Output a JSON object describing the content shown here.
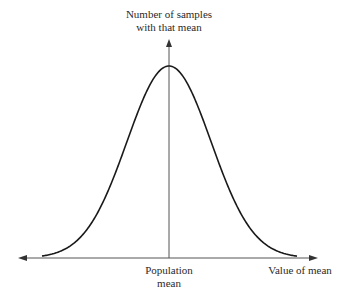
{
  "chart_data": {
    "type": "line",
    "title": "",
    "ylabel": "Number of samples with that mean",
    "xlabel": "Value of mean",
    "x_ticks": [
      "Population mean"
    ],
    "grid": false,
    "legend": null,
    "curve": "normal",
    "x": [
      -3,
      -2.5,
      -2,
      -1.5,
      -1,
      -0.5,
      0,
      0.5,
      1,
      1.5,
      2,
      2.5,
      3
    ],
    "values": [
      0.011,
      0.044,
      0.135,
      0.325,
      0.607,
      0.882,
      1.0,
      0.882,
      0.607,
      0.325,
      0.135,
      0.044,
      0.011
    ]
  },
  "labels": {
    "y_axis_line1": "Number of samples",
    "y_axis_line2": "with that mean",
    "center_line1": "Population",
    "center_line2": "mean",
    "x_axis": "Value of mean"
  },
  "colors": {
    "stroke": "#1a1a1a",
    "axis": "#555555"
  }
}
